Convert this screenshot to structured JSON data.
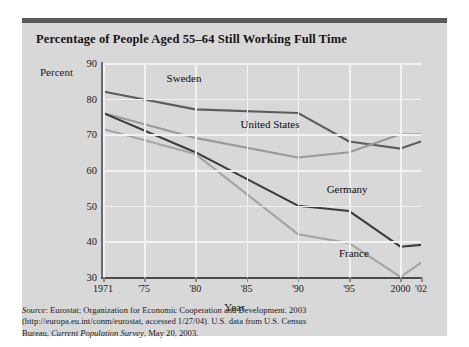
{
  "figure": {
    "title": "Percentage of People Aged 55–64 Still Working Full Time",
    "axis_title_y": "Percent",
    "axis_title_x": "Year",
    "source_prefix": "Source",
    "source_line1": ": Eurostat; Organization for Economic Cooperation and Development. 2003",
    "source_line2": "(http://europa.eu.int/conm/eurostat, accessed 1/27/04). U.S. data from U.S. Census",
    "source_line3a": "Bureau, ",
    "source_line3b": "Current Population Survey",
    "source_line3c": ", May 20, 2003."
  },
  "colors": {
    "background": "#d8d8d8",
    "page": "#ffffff",
    "rule": "#5a5a5a",
    "grid": "#f2f2f2",
    "axis": "#6a6a6a",
    "sweden": "#5d5d5d",
    "united_states": "#9a9a9a",
    "germany": "#3c3c3c",
    "france": "#a5a5a5"
  },
  "chart_data": {
    "type": "line",
    "title": "Percentage of People Aged 55–64 Still Working Full Time",
    "xlabel": "Year",
    "ylabel": "Percent",
    "ylim": [
      30,
      90
    ],
    "xlim": [
      1971,
      2002
    ],
    "ytick_labels": [
      "90",
      "80",
      "70",
      "60",
      "50",
      "40",
      "30"
    ],
    "ytick_values": [
      90,
      80,
      70,
      60,
      50,
      40,
      30
    ],
    "xtick_labels": [
      "1971",
      "'75",
      "'80",
      "'85",
      "'90",
      "'95",
      "2000",
      "'02"
    ],
    "xtick_values": [
      1971,
      1975,
      1980,
      1985,
      1990,
      1995,
      2000,
      2002
    ],
    "grid": true,
    "legend": "inline-labels",
    "x": [
      1971,
      1980,
      1990,
      1995,
      2000,
      2002
    ],
    "series": [
      {
        "name": "Sweden",
        "color": "#5d5d5d",
        "values": [
          82,
          77,
          76,
          68,
          66,
          68
        ],
        "label_x": 1977.2,
        "label_y": 85.5
      },
      {
        "name": "United States",
        "color": "#9a9a9a",
        "values": [
          76,
          69,
          63.5,
          65,
          70,
          70
        ],
        "label_x": 1984.4,
        "label_y": 72.5
      },
      {
        "name": "Germany",
        "color": "#3c3c3c",
        "values": [
          76,
          65,
          50,
          48.5,
          38.5,
          39
        ],
        "label_x": 1992.8,
        "label_y": 54.5
      },
      {
        "name": "France",
        "color": "#a5a5a5",
        "values": [
          71.5,
          64.5,
          42,
          39.5,
          30,
          34
        ],
        "label_x": 1994.0,
        "label_y": 36.5
      }
    ]
  }
}
